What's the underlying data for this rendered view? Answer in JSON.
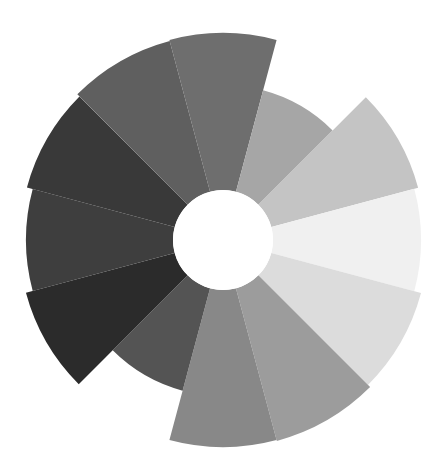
{
  "chart_data": {
    "type": "polar-area",
    "title": "",
    "center": [
      223,
      240
    ],
    "inner_radius": 50,
    "start_angle_deg": -105,
    "sector_angle_deg": 30,
    "direction": "clockwise",
    "legend": [],
    "grid": false,
    "categories": [
      "1",
      "2",
      "3",
      "4",
      "5",
      "6",
      "7",
      "8",
      "9",
      "10",
      "11",
      "12"
    ],
    "values": [
      207,
      155,
      202,
      198,
      205,
      208,
      207,
      156,
      204,
      197,
      203,
      206
    ],
    "colors": [
      "#6e6e6e",
      "#a6a6a6",
      "#c4c4c4",
      "#f0f0f0",
      "#dcdcdc",
      "#9c9c9c",
      "#888888",
      "#545454",
      "#2b2b2b",
      "#3e3e3e",
      "#393939",
      "#5f5f5f"
    ]
  }
}
